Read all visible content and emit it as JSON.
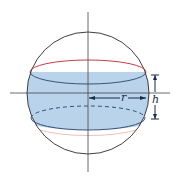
{
  "diagram": {
    "labels": {
      "radius": "r",
      "height": "h"
    },
    "colors": {
      "band_fill": "#b9d3ea",
      "sphere_outline": "#2a2a2a",
      "top_rim": "#c0282d",
      "bottom_rim_dashed": "#2b3f6b",
      "axes": "#444444",
      "dimension": "#1a2a4a"
    }
  }
}
